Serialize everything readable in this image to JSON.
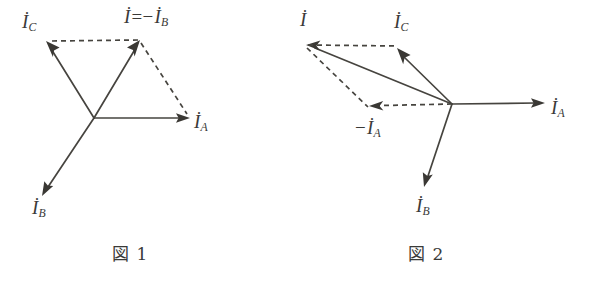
{
  "page": {
    "background_color": "#ffffff",
    "ink_color": "#3a3a38",
    "width": 594,
    "height": 281,
    "kind": "phasor-vector-diagrams"
  },
  "figures": [
    {
      "id": "figure-1",
      "caption": "図 1",
      "origin": [
        94,
        118
      ],
      "labels": {
        "ic": "İ",
        "ic_sub": "C",
        "ia": "İ",
        "ia_sub": "A",
        "ib": "İ",
        "ib_sub": "B",
        "resultant_lead": "İ",
        "resultant_op": "=−",
        "resultant_tail": "İ",
        "resultant_tail_sub": "B"
      },
      "vectors": [
        {
          "name": "I_A",
          "from": [
            94,
            118
          ],
          "to": [
            190,
            118
          ],
          "style": "solid",
          "label": "İA"
        },
        {
          "name": "I_B",
          "from": [
            94,
            118
          ],
          "to": [
            42,
            196
          ],
          "style": "solid",
          "label": "İB"
        },
        {
          "name": "I_C",
          "from": [
            94,
            118
          ],
          "to": [
            46,
            41
          ],
          "style": "solid",
          "label": "İC"
        },
        {
          "name": "I_resultant",
          "from": [
            94,
            118
          ],
          "to": [
            140,
            40
          ],
          "style": "solid",
          "label": "İ=−İB"
        },
        {
          "name": "construction-top",
          "from": [
            140,
            40
          ],
          "to": [
            46,
            41
          ],
          "style": "dashed",
          "label": ""
        },
        {
          "name": "construction-right",
          "from": [
            140,
            40
          ],
          "to": [
            188,
            116
          ],
          "style": "dashed",
          "label": ""
        }
      ]
    },
    {
      "id": "figure-2",
      "caption": "図 2",
      "origin": [
        452,
        104
      ],
      "labels": {
        "i": "İ",
        "ic": "İ",
        "ic_sub": "C",
        "ia": "İ",
        "ia_sub": "A",
        "ib": "İ",
        "ib_sub": "B",
        "neg_ia_op": "−",
        "neg_ia": "İ",
        "neg_ia_sub": "A"
      },
      "vectors": [
        {
          "name": "I_A",
          "from": [
            452,
            104
          ],
          "to": [
            545,
            103
          ],
          "style": "solid",
          "label": "İA"
        },
        {
          "name": "I_B",
          "from": [
            452,
            104
          ],
          "to": [
            424,
            187
          ],
          "style": "solid",
          "label": "İB"
        },
        {
          "name": "I_C",
          "from": [
            452,
            104
          ],
          "to": [
            397,
            48
          ],
          "style": "solid",
          "label": "İC"
        },
        {
          "name": "I_resultant",
          "from": [
            452,
            104
          ],
          "to": [
            306,
            45
          ],
          "style": "solid",
          "label": "İ"
        },
        {
          "name": "neg_I_A",
          "from": [
            452,
            104
          ],
          "to": [
            369,
            106
          ],
          "style": "dashed",
          "label": "−İA"
        },
        {
          "name": "construction-top",
          "from": [
            306,
            45
          ],
          "to": [
            397,
            46
          ],
          "style": "dashed",
          "label": ""
        },
        {
          "name": "construction-diagonal",
          "from": [
            306,
            45
          ],
          "to": [
            368,
            107
          ],
          "style": "dashed",
          "label": ""
        }
      ]
    }
  ]
}
